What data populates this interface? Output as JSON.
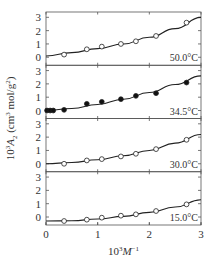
{
  "chart_data": {
    "type": "scatter",
    "layout": "stacked-panels",
    "title": "",
    "xlabel": "10^3 M^-1",
    "xlabel_parts": {
      "base": "10",
      "sup": "3",
      "var": "M",
      "varsup": "−1"
    },
    "ylabel": "10^3 A_2 (cm^3 mol/g^2)",
    "ylabel_parts": {
      "pre": "10",
      "pre_sup": "3",
      "var": "A",
      "var_sub": "2",
      "units_open": " (cm",
      "units_sup1": "3",
      "units_mid": " mol/g",
      "units_sup2": "2",
      "units_close": ")"
    },
    "xlim": [
      0,
      3
    ],
    "xticks": [
      0,
      1,
      2,
      3
    ],
    "xtick_labels": [
      "0",
      "1",
      "2",
      "3"
    ],
    "panel_ylim": [
      -0.6,
      3.4
    ],
    "panel_yticks": [
      0,
      1,
      2,
      3
    ],
    "panel_ytick_labels": [
      "0",
      "1",
      "2",
      "3"
    ],
    "grid": false,
    "legend": "none (temperature annotations inside each panel, lower right)",
    "panels": [
      {
        "label": "50.0°C",
        "marker": "open-circle",
        "points": {
          "x": [
            0.35,
            0.79,
            1.08,
            1.45,
            1.74,
            2.13,
            2.72
          ],
          "y": [
            0.2,
            0.6,
            0.8,
            1.0,
            1.2,
            1.6,
            2.6
          ]
        },
        "fit_curve": {
          "x": [
            0,
            0.5,
            1.0,
            1.5,
            2.0,
            2.5,
            3.0
          ],
          "y": [
            0.1,
            0.35,
            0.65,
            1.0,
            1.5,
            2.15,
            3.0
          ]
        }
      },
      {
        "label": "34.5°C",
        "marker": "filled-circle",
        "points": {
          "x": [
            0.02,
            0.08,
            0.14,
            0.35,
            0.79,
            1.08,
            1.45,
            1.74,
            2.13,
            2.72
          ],
          "y": [
            0.0,
            0.0,
            0.0,
            0.05,
            0.5,
            0.65,
            0.85,
            1.1,
            1.3,
            2.1
          ]
        },
        "fit_curve": {
          "x": [
            0,
            0.5,
            1.0,
            1.5,
            2.0,
            2.5,
            3.0
          ],
          "y": [
            0.0,
            0.15,
            0.45,
            0.85,
            1.35,
            1.95,
            2.6
          ]
        }
      },
      {
        "label": "30.0°C",
        "marker": "open-circle",
        "points": {
          "x": [
            0.35,
            0.79,
            1.08,
            1.45,
            1.74,
            2.13,
            2.72
          ],
          "y": [
            0.0,
            0.25,
            0.35,
            0.55,
            0.75,
            1.1,
            1.8
          ]
        },
        "fit_curve": {
          "x": [
            0,
            0.5,
            1.0,
            1.5,
            2.0,
            2.5,
            3.0
          ],
          "y": [
            0.0,
            0.1,
            0.3,
            0.6,
            1.0,
            1.55,
            2.2
          ]
        }
      },
      {
        "label": "15.0°C",
        "marker": "open-circle",
        "points": {
          "x": [
            0.35,
            0.79,
            1.08,
            1.45,
            1.74,
            2.13,
            2.72
          ],
          "y": [
            -0.3,
            -0.2,
            -0.05,
            0.1,
            0.2,
            0.45,
            0.95
          ]
        },
        "fit_curve": {
          "x": [
            0,
            0.5,
            1.0,
            1.5,
            2.0,
            2.5,
            3.0
          ],
          "y": [
            -0.3,
            -0.28,
            -0.15,
            0.05,
            0.35,
            0.75,
            1.3
          ]
        }
      }
    ]
  },
  "colors": {
    "axis": "#555555",
    "curve": "#222222",
    "marker_fill_open": "#ffffff",
    "marker_fill_filled": "#111111",
    "text": "#333333"
  }
}
